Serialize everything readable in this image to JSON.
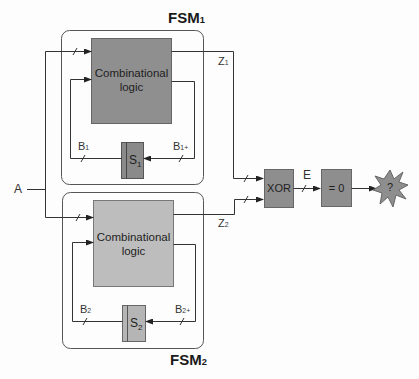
{
  "diagram": {
    "type": "block-diagram",
    "fsm1": {
      "title": "FSM",
      "title_sub": "1",
      "logic_label_line1": "Combinational",
      "logic_label_line2": "logic",
      "register_label": "S",
      "register_sub": "1",
      "state_label": "B",
      "state_sub": "1",
      "next_state_label": "B",
      "next_state_sub": "1+",
      "output_label": "Z",
      "output_sub": "1"
    },
    "fsm2": {
      "title": "FSM",
      "title_sub": "2",
      "logic_label_line1": "Combinational",
      "logic_label_line2": "logic",
      "register_label": "S",
      "register_sub": "2",
      "state_label": "B",
      "state_sub": "2",
      "next_state_label": "B",
      "next_state_sub": "2+",
      "output_label": "Z",
      "output_sub": "2"
    },
    "input_label": "A",
    "xor_label": "XOR",
    "error_label": "E",
    "zero_check_label": "= 0",
    "result_label": "?",
    "colors": {
      "fsm1_logic_fill": "#8f8f8f",
      "fsm2_logic_fill": "#bdbdbd",
      "fsm1_register_fill": "#8a8a8a",
      "fsm2_register_fill": "#b5b5b5",
      "xor_fill": "#8e8e8e",
      "zero_fill": "#8e8e8e",
      "starburst_fill": "#8e8e8e",
      "line": "#3a3a3a",
      "frame": "#555555"
    }
  }
}
